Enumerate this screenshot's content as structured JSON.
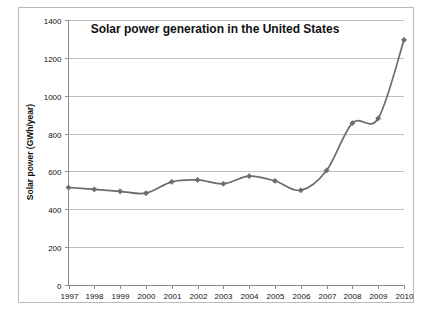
{
  "figure": {
    "title": "Solar power generation in the United States",
    "background_color": "#ffffff",
    "frame_color": "#b9b9b9",
    "series_color": "#6b6b6b",
    "grid_color": "#bfbfbf",
    "axis_color": "#8a8a8a"
  },
  "axes": {
    "ylabel": "Solar power (GWh/year)",
    "xlabel": "",
    "yticks": [
      "0",
      "200",
      "400",
      "600",
      "800",
      "1000",
      "1200",
      "1400"
    ],
    "xticks": [
      "1997",
      "1998",
      "1999",
      "2000",
      "2001",
      "2002",
      "2003",
      "2004",
      "2005",
      "2006",
      "2007",
      "2008",
      "2009",
      "2010"
    ]
  },
  "chart_data": {
    "type": "line",
    "title": "Solar power generation in the United States",
    "xlabel": "",
    "ylabel": "Solar power (GWh/year)",
    "categories": [
      "1997",
      "1998",
      "1999",
      "2000",
      "2001",
      "2002",
      "2003",
      "2004",
      "2005",
      "2006",
      "2007",
      "2008",
      "2009",
      "2010"
    ],
    "x": [
      1997,
      1998,
      1999,
      2000,
      2001,
      2002,
      2003,
      2004,
      2005,
      2006,
      2007,
      2008,
      2009,
      2010
    ],
    "values": [
      515,
      505,
      495,
      485,
      545,
      555,
      535,
      575,
      550,
      500,
      605,
      855,
      880,
      1295
    ],
    "ylim": [
      0,
      1400
    ],
    "xlim": [
      1997,
      2010
    ],
    "ytick_step": 200,
    "grid": "horizontal",
    "legend": "none",
    "marker": "diamond",
    "series": [
      {
        "name": "Solar power generation",
        "values": [
          515,
          505,
          495,
          485,
          545,
          555,
          535,
          575,
          550,
          500,
          605,
          855,
          880,
          1295
        ]
      }
    ]
  }
}
